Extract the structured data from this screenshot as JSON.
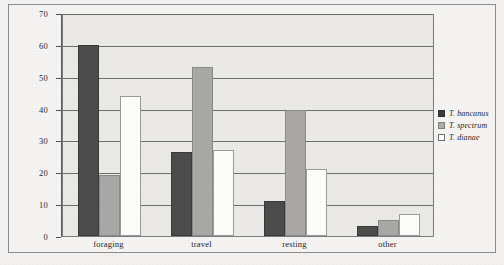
{
  "chart_data": {
    "type": "bar",
    "title": "",
    "xlabel": "",
    "ylabel": "",
    "ylim": [
      0,
      70
    ],
    "yticks": [
      0,
      10,
      20,
      30,
      40,
      50,
      60,
      70
    ],
    "grid": true,
    "legend_position": "right",
    "categories": [
      "foraging",
      "travel",
      "resting",
      "other"
    ],
    "series": [
      {
        "name": "T. bancanus",
        "color": "#4c4c4c",
        "values": [
          60,
          26.5,
          11,
          3
        ]
      },
      {
        "name": "T. spectrum",
        "color": "#aaa9a7",
        "values": [
          19,
          53,
          39.5,
          5
        ]
      },
      {
        "name": "T. dianae",
        "color": "#fdfdfc",
        "values": [
          44,
          27,
          21,
          7
        ]
      }
    ]
  },
  "legend": {
    "items": [
      {
        "label": "T. bancanus",
        "swatch": "filled-dark-square-icon"
      },
      {
        "label": "T. spectrum",
        "swatch": "filled-gray-square-icon"
      },
      {
        "label": "T. dianae",
        "swatch": "empty-white-square-icon"
      }
    ]
  }
}
